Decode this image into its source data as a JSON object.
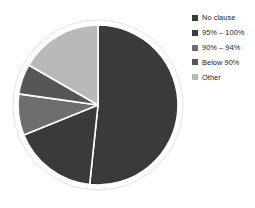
{
  "chart_data": {
    "type": "pie",
    "title": "",
    "subtitle": "",
    "xlabel": "",
    "ylabel": "",
    "grid": false,
    "legend_position": "right",
    "start_angle_deg": 0,
    "direction": "clockwise",
    "categories": [
      "No clause",
      "95% – 100%",
      "90% – 94%",
      "Below 90%",
      "Other"
    ],
    "values": [
      51.7,
      17.2,
      8.3,
      6.1,
      16.7
    ],
    "units": "percent",
    "slice_angles_deg": [
      186,
      62,
      30,
      22,
      60
    ],
    "series": [
      {
        "name": "Share of responses",
        "values": [
          51.7,
          17.2,
          8.3,
          6.1,
          16.7
        ]
      }
    ],
    "colors": [
      "#3a3a3a",
      "#3a3a3a",
      "#6e6e6e",
      "#565656",
      "#b9b9b9"
    ],
    "annotations": []
  },
  "legend": {
    "items": [
      {
        "label": "No clause",
        "color": "#3a3a3a",
        "swatch_icon": "square-swatch-icon"
      },
      {
        "label": "95% – 100%",
        "color": "#3a3a3a",
        "swatch_icon": "square-swatch-icon"
      },
      {
        "label": "90% – 94%",
        "color": "#6e6e6e",
        "swatch_icon": "square-swatch-icon"
      },
      {
        "label": "Below 90%",
        "color": "#565656",
        "swatch_icon": "square-swatch-icon"
      },
      {
        "label": "Other",
        "color": "#b9b9b9",
        "swatch_icon": "square-swatch-icon"
      }
    ]
  },
  "pie": {
    "center_x": 98,
    "center_y": 105,
    "radius": 80,
    "ring_color": "#ffffff",
    "ring_outer_radius": 85,
    "separator_color": "#ffffff",
    "background": "#ffffff"
  }
}
